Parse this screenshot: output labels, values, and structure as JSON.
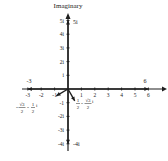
{
  "diagram": {
    "axis_label_y": "Imaginary",
    "colors": {
      "ink": "#1e1e1e",
      "background": "#ffffff"
    },
    "origin_px": [
      68,
      89
    ],
    "unit_px_x": 13.4,
    "unit_px_y": 13.7,
    "x_ticks": [
      {
        "value": -3,
        "label": "-3"
      },
      {
        "value": -2,
        "label": "-2"
      },
      {
        "value": -1,
        "label": "-1"
      },
      {
        "value": 1,
        "label": "1"
      },
      {
        "value": 2,
        "label": "2"
      },
      {
        "value": 3,
        "label": "3"
      },
      {
        "value": 4,
        "label": "4"
      },
      {
        "value": 5,
        "label": "5"
      },
      {
        "value": 6,
        "label": "6"
      }
    ],
    "y_ticks": [
      {
        "value": 5,
        "label": "5i"
      },
      {
        "value": 4,
        "label": "4i"
      },
      {
        "value": 3,
        "label": "3i"
      },
      {
        "value": 2,
        "label": "2i"
      },
      {
        "value": 1,
        "label": "i"
      },
      {
        "value": -1,
        "label": "-1"
      },
      {
        "value": -2,
        "label": "-2i"
      },
      {
        "value": -3,
        "label": "-3i"
      },
      {
        "value": -4,
        "label": "-4i"
      }
    ],
    "points": [
      {
        "re": 0,
        "im": 5,
        "label": "5i"
      },
      {
        "re": 0,
        "im": -4,
        "label": "-4i"
      },
      {
        "re": 6,
        "im": 0,
        "label": "6"
      },
      {
        "re": -3,
        "im": 0,
        "label": "-3"
      },
      {
        "re": -0.866,
        "im": -0.5,
        "label_num1": "√3",
        "label_den1": "2",
        "label_num2": "1",
        "label_den2": "2",
        "label": "-√3/2 - 1/2 i"
      },
      {
        "re": 0.5,
        "im": -0.866,
        "label_num1": "1",
        "label_den1": "2",
        "label_num2": "√3",
        "label_den2": "2",
        "label": "1/2 - √3/2 i"
      }
    ]
  }
}
